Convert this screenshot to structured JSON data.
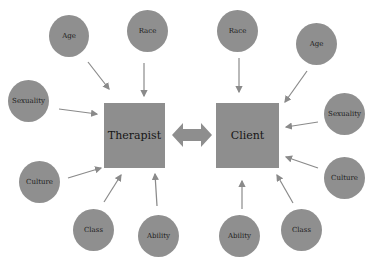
{
  "diagram": {
    "colors": {
      "node_fill": "#8f8f8f",
      "arrow": "#8a8a8a",
      "background": "#ffffff",
      "text": "#1c1c1c"
    },
    "center_nodes": {
      "therapist": {
        "label": "Therapist"
      },
      "client": {
        "label": "Client"
      },
      "connector": "bidirectional-arrow"
    },
    "therapist_factors": [
      {
        "label": "Age"
      },
      {
        "label": "Race"
      },
      {
        "label": "Sexuality"
      },
      {
        "label": "Culture"
      },
      {
        "label": "Class"
      },
      {
        "label": "Ability"
      }
    ],
    "client_factors": [
      {
        "label": "Race"
      },
      {
        "label": "Age"
      },
      {
        "label": "Sexuality"
      },
      {
        "label": "Culture"
      },
      {
        "label": "Ability"
      },
      {
        "label": "Class"
      }
    ]
  }
}
